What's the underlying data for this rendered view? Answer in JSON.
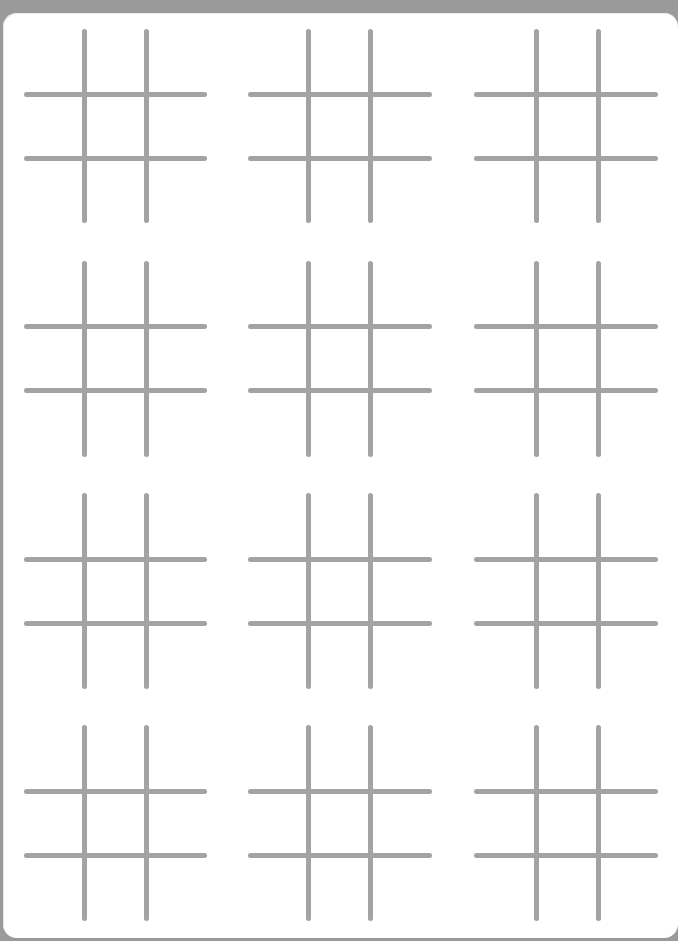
{
  "page": {
    "title": "",
    "background_color": "#9a9a9a",
    "sheet_color": "#ffffff",
    "line_color": "#a3a3a3"
  },
  "grid": {
    "rows": 4,
    "columns": 3,
    "boards": [
      {
        "row": 1,
        "col": 1,
        "cells": [
          "",
          "",
          "",
          "",
          "",
          "",
          "",
          "",
          ""
        ]
      },
      {
        "row": 1,
        "col": 2,
        "cells": [
          "",
          "",
          "",
          "",
          "",
          "",
          "",
          "",
          ""
        ]
      },
      {
        "row": 1,
        "col": 3,
        "cells": [
          "",
          "",
          "",
          "",
          "",
          "",
          "",
          "",
          ""
        ]
      },
      {
        "row": 2,
        "col": 1,
        "cells": [
          "",
          "",
          "",
          "",
          "",
          "",
          "",
          "",
          ""
        ]
      },
      {
        "row": 2,
        "col": 2,
        "cells": [
          "",
          "",
          "",
          "",
          "",
          "",
          "",
          "",
          ""
        ]
      },
      {
        "row": 2,
        "col": 3,
        "cells": [
          "",
          "",
          "",
          "",
          "",
          "",
          "",
          "",
          ""
        ]
      },
      {
        "row": 3,
        "col": 1,
        "cells": [
          "",
          "",
          "",
          "",
          "",
          "",
          "",
          "",
          ""
        ]
      },
      {
        "row": 3,
        "col": 2,
        "cells": [
          "",
          "",
          "",
          "",
          "",
          "",
          "",
          "",
          ""
        ]
      },
      {
        "row": 3,
        "col": 3,
        "cells": [
          "",
          "",
          "",
          "",
          "",
          "",
          "",
          "",
          ""
        ]
      },
      {
        "row": 4,
        "col": 1,
        "cells": [
          "",
          "",
          "",
          "",
          "",
          "",
          "",
          "",
          ""
        ]
      },
      {
        "row": 4,
        "col": 2,
        "cells": [
          "",
          "",
          "",
          "",
          "",
          "",
          "",
          "",
          ""
        ]
      },
      {
        "row": 4,
        "col": 3,
        "cells": [
          "",
          "",
          "",
          "",
          "",
          "",
          "",
          "",
          ""
        ]
      }
    ]
  }
}
